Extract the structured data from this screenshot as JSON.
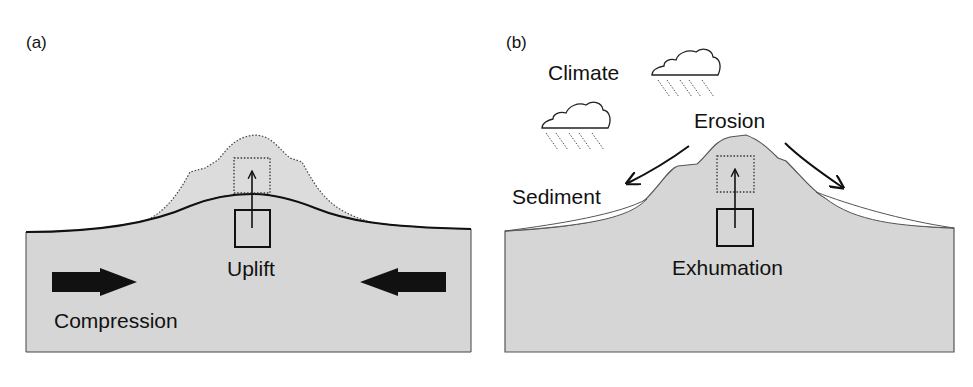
{
  "figure": {
    "panel_a": {
      "label": "(a)",
      "labels": {
        "uplift": "Uplift",
        "compression": "Compression"
      },
      "elements": [
        "compression-arrow-left",
        "compression-arrow-right",
        "uplifted-block",
        "dotted-topography",
        "smooth-surface"
      ]
    },
    "panel_b": {
      "label": "(b)",
      "labels": {
        "climate": "Climate",
        "erosion": "Erosion",
        "sediment": "Sediment",
        "exhumation": "Exhumation"
      },
      "elements": [
        "rain-cloud",
        "rain-cloud",
        "erosion-arrow-left",
        "erosion-arrow-right",
        "sediment-wedge",
        "exhumed-block"
      ]
    },
    "colors": {
      "crust_fill": "#d6d6d6",
      "outline": "#222222",
      "sediment_fill": "#ffffff",
      "background": "#ffffff"
    }
  }
}
